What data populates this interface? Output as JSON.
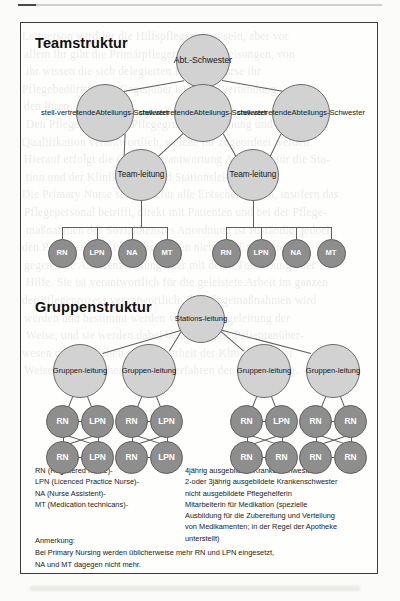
{
  "page": {
    "background_text_lines": [
      "Leitperson wird für die Hilfspflegerinnen sein, aber vor",
      "allem ihr gibt die Primärpflegerin die Anweisungen, von",
      "ihr wissen die sich delegierten Primary Nurse ihr",
      "Pflegebedürftig. Ihr Gegenüber ist nur in Verbindung",
      "den Ihren.",
      "Den Pflegerinnen der Pflegegruppe Anordnung und",
      "Qualifikation verantwortlich, welche ihr zugeordnet werden.",
      "Hierauf erfolgt die Gesamtverantwortung Abteilung für die Sta-",
      "tion und der Klinikleitung und Stationsleitung.",
      "Die Primary Nurse selbst ist für alle Entscheidungen, insofern das",
      "Pflegepersonal betrifft, direkt mit Patienten und bei der Pflege-",
      "maßnahmen des Sozialdienstes Anordnung ist zuständig, jedoch",
      "den Personen selbst beteiligt gegen nicht die Entscheidung.",
      "gegen eine Assistenzleistung oder mit deren Teilhabung oder",
      "Hilfe. Sie ist verantwortlich für die geleistete Arbeit im ganzen",
      "der Pflegeprozess verantwortlich. Ihr Pflegemaßnahmen wird",
      "werden und bestimmt werden von der Pflegeleitung der",
      "Weise, und sie werden dabei beurteilen die Patientenüber-",
      "wesen und Sicherheit und Sicherheit der Klinik in dieser",
      "Weise und Sicherheit mit den Verfahren der Teamleitung."
    ]
  },
  "figure": {
    "team_section": {
      "title": "Teamstruktur",
      "root": {
        "lines": [
          "Abt.-",
          "Schwester"
        ]
      },
      "deputies": [
        {
          "lines": [
            "stell-",
            "vertretende",
            "Abteilungs-",
            "Schwester"
          ]
        },
        {
          "lines": [
            "stell-",
            "vertretende",
            "Abteilungs-",
            "Schwester"
          ]
        },
        {
          "lines": [
            "stell-",
            "vertretende",
            "Abteilungs-",
            "Schwester"
          ]
        }
      ],
      "team_leads": [
        {
          "lines": [
            "Team-",
            "leitung"
          ]
        },
        {
          "lines": [
            "Team-",
            "leitung"
          ]
        }
      ],
      "staff_groups": [
        [
          "RN",
          "LPN",
          "NA",
          "MT"
        ],
        [
          "RN",
          "LPN",
          "NA",
          "MT"
        ]
      ]
    },
    "group_section": {
      "title": "Gruppenstruktur",
      "root": {
        "lines": [
          "Stations-",
          "leitung"
        ]
      },
      "group_leads": [
        {
          "lines": [
            "Gruppen-",
            "leitung"
          ]
        },
        {
          "lines": [
            "Gruppen-",
            "leitung"
          ]
        },
        {
          "lines": [
            "Gruppen-",
            "leitung"
          ]
        },
        {
          "lines": [
            "Gruppen-",
            "leitung"
          ]
        }
      ],
      "groups": [
        {
          "members": [
            "RN",
            "LPN",
            "RN",
            "LPN"
          ]
        },
        {
          "members": [
            "RN",
            "LPN",
            "RN",
            "LPN"
          ]
        },
        {
          "members": [
            "RN",
            "LPN",
            "RN",
            "RN"
          ]
        },
        {
          "members": [
            "RN",
            "RN",
            "RN",
            "RN"
          ]
        }
      ]
    },
    "legend": {
      "left": [
        "RN (Registered Nurse)-",
        "LPN (Licenced Practice Nurse)-",
        "NA (Nurse Assistent)-",
        "MT (Medication technicans)-"
      ],
      "right": [
        "4jährig ausgebildete Krankenschwester",
        "2-oder 3jährig ausgebildete Krankenschwester",
        "nicht ausgebildete Pflegehelferin",
        "Mitarbeiterin für Medikation (spezielle",
        "Ausbildung für die Zubereitung und Verteilung",
        "von Medikamenten; in der Regel der Apotheke",
        "unterstellt)"
      ]
    },
    "note": {
      "heading": "Anmerkung:",
      "lines": [
        "Bei Primary Nursing werden üblicherweise mehr RN und LPN eingesetzt,",
        "NA und MT dagegen nicht mehr."
      ]
    }
  },
  "colors": {
    "node_light_fill": "#d2d2d2",
    "node_dark_fill": "#8e8e8e",
    "node_stroke": "#5e5e5e",
    "frame_stroke": "#3b3b3b",
    "page_background": "#fbfbf9",
    "bleed_text": "#c9c7c2"
  }
}
